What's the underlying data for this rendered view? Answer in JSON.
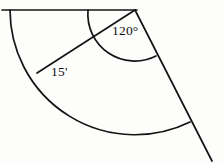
{
  "figure": {
    "kind": "geometry-diagram",
    "background_color": "#fdfdfc",
    "stroke_color": "#141414",
    "stroke_width_px": 1.6,
    "labels": {
      "central_angle": "120°",
      "radius": "15'"
    },
    "geometry": {
      "apex": {
        "x": 135,
        "y": 10
      },
      "radius_px": 125,
      "angle_arc_radius_px": 47,
      "baseline": {
        "x1": 2,
        "y1": 10,
        "x2": 135,
        "y2": 10
      },
      "ray_extension_end": {
        "x": 212,
        "y": 161
      },
      "sector_start_angle_deg": 180,
      "sector_end_angle_deg": 63,
      "radius_line_end": {
        "x": 38,
        "y": 72
      }
    }
  }
}
